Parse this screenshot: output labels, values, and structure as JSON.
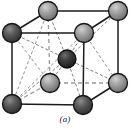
{
  "figure": {
    "caption": "(a)",
    "background_color": "#ffffff",
    "solid_edge_color": "#1c1c1c",
    "hidden_edge_color": "#9a9a9a",
    "diagonal_line_color": "#777777",
    "atom_fill_color": "#8a8a8a",
    "atom_outline_color": "#1c1c1c",
    "atom_highlight_color": "#c9c9c9",
    "center_atom_fill_color": "#3c3c3c"
  },
  "structure": {
    "type": "bcc",
    "atom_count": 9,
    "corner_atom_count": 8,
    "center_atom_count": 1,
    "atoms": [
      {
        "name": "top-back-left",
        "x": 48,
        "y": 11,
        "r": 9.5,
        "shade": "light"
      },
      {
        "name": "top-back-right",
        "x": 118,
        "y": 11,
        "r": 9.5,
        "shade": "light"
      },
      {
        "name": "top-front-left",
        "x": 12,
        "y": 33,
        "r": 9.5,
        "shade": "dark"
      },
      {
        "name": "top-front-right",
        "x": 84,
        "y": 33,
        "r": 9.5,
        "shade": "light"
      },
      {
        "name": "center",
        "x": 67,
        "y": 59,
        "r": 9.0,
        "shade": "center"
      },
      {
        "name": "bottom-back-left",
        "x": 50,
        "y": 83,
        "r": 9.5,
        "shade": "light"
      },
      {
        "name": "bottom-back-right",
        "x": 118,
        "y": 83,
        "r": 9.5,
        "shade": "light"
      },
      {
        "name": "bottom-front-left",
        "x": 12,
        "y": 104,
        "r": 9.5,
        "shade": "dark"
      },
      {
        "name": "bottom-front-right",
        "x": 83,
        "y": 105,
        "r": 9.5,
        "shade": "dark"
      }
    ],
    "solid_edges": [
      {
        "name": "edge-top-front",
        "x1": 12,
        "y1": 33,
        "x2": 84,
        "y2": 33
      },
      {
        "name": "edge-bottom-front",
        "x1": 12,
        "y1": 104,
        "x2": 83,
        "y2": 105
      },
      {
        "name": "edge-left-front-vert",
        "x1": 12,
        "y1": 33,
        "x2": 12,
        "y2": 104
      },
      {
        "name": "edge-right-front-vert",
        "x1": 84,
        "y1": 33,
        "x2": 83,
        "y2": 105
      },
      {
        "name": "edge-top-back",
        "x1": 48,
        "y1": 11,
        "x2": 118,
        "y2": 11
      },
      {
        "name": "edge-right-back-vert",
        "x1": 118,
        "y1": 11,
        "x2": 118,
        "y2": 83
      },
      {
        "name": "edge-top-left-diag",
        "x1": 12,
        "y1": 33,
        "x2": 48,
        "y2": 11
      },
      {
        "name": "edge-top-right-diag",
        "x1": 84,
        "y1": 33,
        "x2": 118,
        "y2": 11
      },
      {
        "name": "edge-bottom-right-diag",
        "x1": 83,
        "y1": 105,
        "x2": 118,
        "y2": 83
      }
    ],
    "hidden_edges": [
      {
        "name": "hidden-left-back-vert",
        "x1": 48,
        "y1": 11,
        "x2": 50,
        "y2": 83
      },
      {
        "name": "hidden-bottom-back",
        "x1": 50,
        "y1": 83,
        "x2": 118,
        "y2": 83
      },
      {
        "name": "hidden-bottom-left-diag",
        "x1": 12,
        "y1": 104,
        "x2": 50,
        "y2": 83
      }
    ],
    "body_diagonals": [
      {
        "name": "diag-center-to-top-back-left",
        "x1": 67,
        "y1": 59,
        "x2": 48,
        "y2": 11
      },
      {
        "name": "diag-center-to-top-back-right",
        "x1": 67,
        "y1": 59,
        "x2": 118,
        "y2": 11
      },
      {
        "name": "diag-center-to-top-front-left",
        "x1": 67,
        "y1": 59,
        "x2": 12,
        "y2": 33
      },
      {
        "name": "diag-center-to-top-front-right",
        "x1": 67,
        "y1": 59,
        "x2": 84,
        "y2": 33
      },
      {
        "name": "diag-center-to-bottom-back-left",
        "x1": 67,
        "y1": 59,
        "x2": 50,
        "y2": 83
      },
      {
        "name": "diag-center-to-bottom-back-right",
        "x1": 67,
        "y1": 59,
        "x2": 118,
        "y2": 83
      },
      {
        "name": "diag-center-to-bottom-front-left",
        "x1": 67,
        "y1": 59,
        "x2": 12,
        "y2": 104
      },
      {
        "name": "diag-center-to-bottom-front-right",
        "x1": 67,
        "y1": 59,
        "x2": 83,
        "y2": 105
      }
    ],
    "face_diagonals": [
      {
        "name": "face-diag-top-front-left-to-bottom-back-left",
        "x1": 12,
        "y1": 33,
        "x2": 50,
        "y2": 83
      },
      {
        "name": "face-diag-top-front-right-to-bottom-front-left",
        "x1": 84,
        "y1": 33,
        "x2": 12,
        "y2": 104
      },
      {
        "name": "face-diag-top-back-left-to-bottom-front-left",
        "x1": 48,
        "y1": 11,
        "x2": 12,
        "y2": 104
      },
      {
        "name": "face-diag-top-front-right-to-bottom-back-right",
        "x1": 84,
        "y1": 33,
        "x2": 118,
        "y2": 83
      }
    ]
  }
}
